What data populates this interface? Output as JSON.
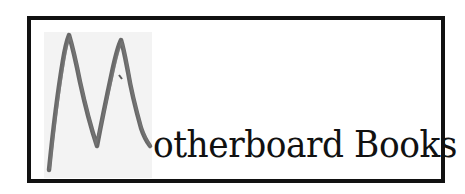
{
  "logo": {
    "initial_letter": "M",
    "wordmark_rest": "otherboard Books",
    "full_name": "Motherboard Books",
    "colors": {
      "border": "#111111",
      "text": "#111111",
      "handwritten_stroke": "#5a5a5a",
      "handwritten_patch": "#f3f3f3",
      "background": "#ffffff"
    },
    "icon": "handwritten-m-icon"
  }
}
